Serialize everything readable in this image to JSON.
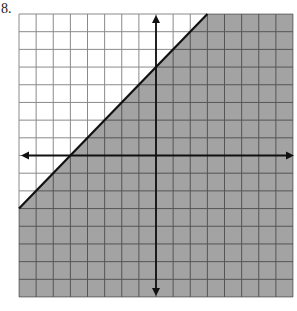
{
  "problem": {
    "number_label": "8."
  },
  "chart_data": {
    "type": "inequality-graph",
    "title": "",
    "xlabel": "",
    "ylabel": "",
    "xlim": [
      -8,
      8
    ],
    "ylim": [
      -8,
      8
    ],
    "grid": true,
    "grid_step": 1,
    "axes": {
      "x_arrows": true,
      "y_arrows": true,
      "tick_labels": false
    },
    "boundary_line": {
      "equation": "y = x + 5",
      "slope": 1,
      "intercept": 5,
      "style": "solid",
      "points": [
        [
          -8,
          -3
        ],
        [
          3,
          8
        ]
      ]
    },
    "inequality": "y <= x + 5",
    "shaded_region": "below-right of line",
    "colors": {
      "shade": "#a3a3a3",
      "grid_unshaded": "#8a8a8a",
      "grid_shaded": "#555555",
      "axis": "#111111",
      "boundary": "#111111"
    }
  }
}
